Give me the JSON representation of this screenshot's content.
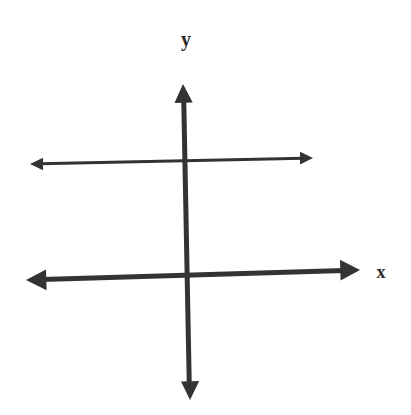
{
  "diagram": {
    "title": "",
    "colors": {
      "background": "#ffffff",
      "stroke": "#333333",
      "label": "#2a2a2a"
    },
    "labels": {
      "x_axis": "x",
      "y_axis": "y"
    },
    "elements": {
      "y_axis": {
        "start": [
          190,
          400
        ],
        "end": [
          183,
          84
        ],
        "stroke_width": 5,
        "arrows": "both"
      },
      "x_axis": {
        "start": [
          26,
          280
        ],
        "end": [
          360,
          270
        ],
        "stroke_width": 5,
        "arrows": "both"
      },
      "horizontal_line": {
        "start": [
          30,
          164
        ],
        "end": [
          313,
          158
        ],
        "stroke_width": 3,
        "arrows": "both"
      }
    }
  }
}
